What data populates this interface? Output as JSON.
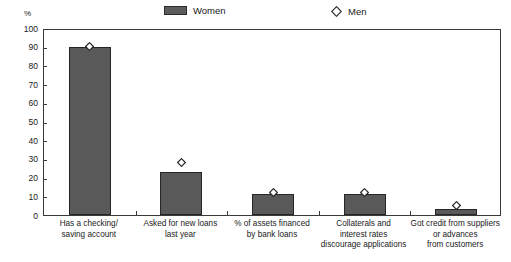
{
  "axis_unit": "%",
  "legend": {
    "women": {
      "label": "Women",
      "icon": "bar-swatch",
      "color": "#595959"
    },
    "men": {
      "label": "Men",
      "icon": "diamond-marker",
      "color": "#ffffff"
    }
  },
  "chart_data": {
    "type": "bar",
    "title": "",
    "subtitle": "",
    "xlabel": "",
    "ylabel": "%",
    "ylim": [
      0,
      100
    ],
    "yticks": [
      0,
      10,
      20,
      30,
      40,
      50,
      60,
      70,
      80,
      90,
      100
    ],
    "grid": false,
    "legend_position": "top-center",
    "categories": [
      "Has a checking/\nsaving account",
      "Asked for new loans\nlast year",
      "% of assets financed\nby bank loans",
      "Collaterals and\ninterest rates\ndiscourage applications",
      "Got credit from suppliers\nor advances\nfrom customers"
    ],
    "category_lines": [
      [
        "Has a checking/",
        "saving account"
      ],
      [
        "Asked for new loans",
        "last year"
      ],
      [
        "% of assets financed",
        "by bank loans"
      ],
      [
        "Collaterals and",
        "interest rates",
        "discourage applications"
      ],
      [
        "Got credit from suppliers",
        "or advances",
        "from customers"
      ]
    ],
    "series": [
      {
        "name": "Women",
        "marker": "bar",
        "values": [
          90,
          23,
          11,
          11,
          3
        ]
      },
      {
        "name": "Men",
        "marker": "diamond",
        "values": [
          91,
          29,
          13,
          13,
          6
        ]
      }
    ]
  }
}
